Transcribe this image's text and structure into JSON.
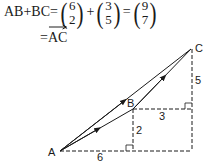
{
  "equation": {
    "lhs": "AB+BC=",
    "vector1": {
      "top": "6",
      "bottom": "2"
    },
    "plus": "+",
    "vector2": {
      "top": "3",
      "bottom": "5"
    },
    "equals": "=",
    "vector3": {
      "top": "9",
      "bottom": "7"
    },
    "line2_equals": "=",
    "result": "AC"
  },
  "diagram": {
    "points": {
      "A": {
        "label": "A",
        "x": 60,
        "y": 151
      },
      "B": {
        "label": "B",
        "x": 133,
        "y": 109
      },
      "C": {
        "label": "C",
        "x": 191,
        "y": 49
      }
    },
    "measures": {
      "horizontal_AB": "6",
      "vertical_AB": "2",
      "horizontal_BC": "3",
      "vertical_BC": "5"
    },
    "colors": {
      "stroke": "#1a1a1a"
    }
  }
}
